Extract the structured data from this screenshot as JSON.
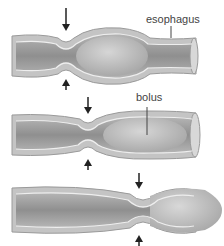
{
  "diagram": {
    "labels": {
      "esophagus": "esophagus",
      "bolus": "bolus"
    },
    "stages": [
      {
        "id": 1,
        "constriction_x": 66,
        "bolus_x": 112,
        "arrow_top_y": 10,
        "arrow_bottom_y": 72
      },
      {
        "id": 2,
        "constriction_x": 88,
        "bolus_x": 148,
        "arrow_top_y": 0,
        "arrow_bottom_y": 62
      },
      {
        "id": 3,
        "constriction_x": 143,
        "bolus_x": 190,
        "arrow_top_y": 0,
        "arrow_bottom_y": 62
      }
    ],
    "colors": {
      "tube_outer": "#a8a8a8",
      "tube_wall": "#c9c9c9",
      "tube_inner_dark": "#8e8e8e",
      "bolus": "#bdbdbd",
      "edge": "#eeeeee",
      "arrow": "#222222",
      "text": "#444444"
    }
  }
}
